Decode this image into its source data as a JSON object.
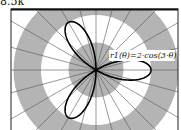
{
  "corner_text": "8.5k",
  "chart_data": {
    "type": "line",
    "subtype": "polar",
    "title": "",
    "series": [
      {
        "name": "r1(θ)=2·cos(3·θ)",
        "function": "2*cos(3*theta)",
        "theta_range": [
          0,
          3.14159
        ]
      }
    ],
    "annotation": "r1(θ)=2·cos(3·θ)",
    "radial_bands": [
      1,
      2,
      3,
      4
    ],
    "angular_grid_step_deg": 15,
    "grid": true,
    "colors": {
      "band": "#b4b4b4",
      "curve": "#000000",
      "grid": "#555555"
    }
  }
}
